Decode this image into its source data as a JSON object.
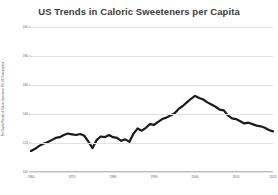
{
  "chart_data": {
    "type": "line",
    "title": "US Trends in Caloric Sweeteners per Capita",
    "xlabel": "",
    "ylabel": "Per Capita Pounds of Caloric Sweetener Per US Consumption",
    "xlim": [
      1960,
      2019
    ],
    "ylim": [
      100,
      200
    ],
    "grid": true,
    "legend": false,
    "yticks": [
      100,
      120,
      140,
      160,
      180,
      200
    ],
    "ytick_labels": [
      "100",
      "120",
      "140",
      "160",
      "180",
      "200"
    ],
    "xticks": [
      1960,
      1970,
      1980,
      1990,
      2000,
      2010,
      2019
    ],
    "xtick_labels": [
      "1960",
      "1970",
      "1980",
      "1990",
      "2000",
      "2010",
      "2019"
    ],
    "series": [
      {
        "name": "Caloric Sweeteners per Capita",
        "color": "#1a1a1a",
        "x": [
          1960,
          1961,
          1962,
          1963,
          1964,
          1965,
          1966,
          1967,
          1968,
          1969,
          1970,
          1971,
          1972,
          1973,
          1974,
          1975,
          1976,
          1977,
          1978,
          1979,
          1980,
          1981,
          1982,
          1983,
          1984,
          1985,
          1986,
          1987,
          1988,
          1989,
          1990,
          1991,
          1992,
          1993,
          1994,
          1995,
          1996,
          1997,
          1998,
          1999,
          2000,
          2001,
          2002,
          2003,
          2004,
          2005,
          2006,
          2007,
          2008,
          2009,
          2010,
          2011,
          2012,
          2013,
          2014,
          2015,
          2016,
          2017,
          2018,
          2019
        ],
        "values": [
          114.5,
          116.0,
          118.0,
          119.5,
          120.5,
          122.0,
          123.5,
          124.0,
          125.5,
          126.5,
          126.0,
          125.5,
          126.2,
          125.0,
          121.0,
          116.5,
          122.0,
          124.5,
          124.0,
          125.5,
          124.0,
          123.5,
          121.5,
          122.5,
          120.8,
          126.5,
          130.0,
          128.5,
          130.5,
          133.0,
          132.5,
          134.5,
          136.5,
          137.5,
          139.0,
          140.5,
          143.5,
          145.5,
          148.0,
          150.5,
          152.5,
          151.0,
          150.0,
          148.0,
          146.5,
          145.0,
          143.0,
          142.5,
          139.0,
          137.0,
          136.5,
          135.0,
          133.5,
          134.0,
          133.0,
          132.0,
          131.5,
          130.5,
          129.0,
          128.0
        ]
      }
    ]
  }
}
